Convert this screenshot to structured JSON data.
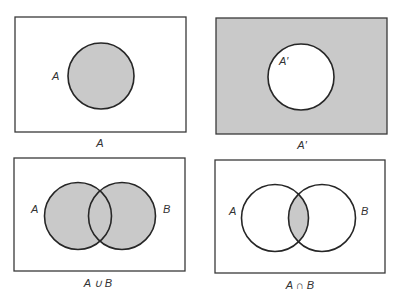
{
  "colors": {
    "shade": "#c9c9c9",
    "background": "#ffffff",
    "stroke": "#262626"
  },
  "diagrams": [
    {
      "id": "set-a",
      "caption": "A",
      "circle_labels": [
        "A"
      ],
      "shaded_region": "inside A"
    },
    {
      "id": "complement-a",
      "caption": "A′",
      "circle_labels": [
        "A′"
      ],
      "shaded_region": "outside A (universe minus A)"
    },
    {
      "id": "union",
      "caption": "A ∪ B",
      "circle_labels": [
        "A",
        "B"
      ],
      "shaded_region": "A or B"
    },
    {
      "id": "intersection",
      "caption": "A ∩ B",
      "circle_labels": [
        "A",
        "B"
      ],
      "shaded_region": "A and B"
    }
  ]
}
